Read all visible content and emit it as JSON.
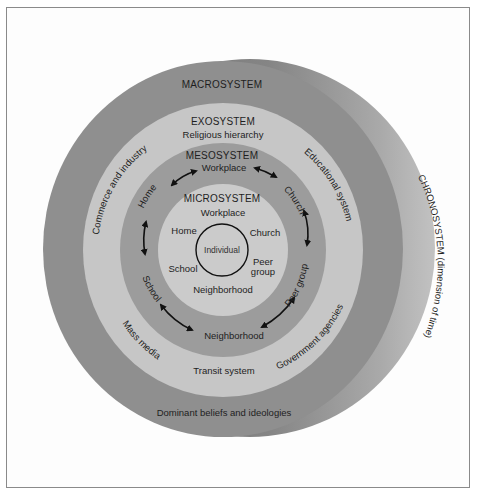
{
  "diagram": {
    "colors": {
      "background": "#ffffff",
      "frame": "#8a8a8a",
      "chronosystem": "#7c7c7c",
      "chronosystem_highlight": "#b8b8b8",
      "macrosystem": "#8f8f8f",
      "exosystem": "#c6c6c6",
      "mesosystem": "#9c9c9c",
      "microsystem": "#cbcbcb",
      "individual_stroke": "#111111",
      "text": "#1e1e1e"
    },
    "chronosystem": {
      "label": "CHRONOSYSTEM (dimension of time)"
    },
    "macrosystem": {
      "label": "MACROSYSTEM",
      "items": [
        "Dominant beliefs and ideologies"
      ]
    },
    "exosystem": {
      "label": "EXOSYSTEM",
      "items": [
        "Religious hierarchy",
        "Commerce and industry",
        "Educational system",
        "Mass media",
        "Government agencies",
        "Transit system"
      ]
    },
    "mesosystem": {
      "label": "MESOSYSTEM",
      "items": [
        "Workplace",
        "Home",
        "Church",
        "School",
        "Peer group",
        "Neighborhood"
      ]
    },
    "microsystem": {
      "label": "MICROSYSTEM",
      "items": [
        "Workplace",
        "Home",
        "Church",
        "School",
        "Peer",
        "group",
        "Neighborhood"
      ]
    },
    "center": {
      "label": "Individual"
    }
  }
}
